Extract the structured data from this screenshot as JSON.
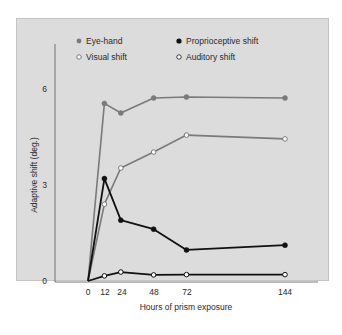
{
  "chart_data": {
    "type": "line",
    "title": "",
    "xlabel": "Hours of prism exposure",
    "ylabel": "Adaptive shift (deg.)",
    "x": [
      0,
      12,
      24,
      48,
      72,
      144
    ],
    "xticks": [
      "0",
      "12",
      "24",
      "48",
      "72",
      "144"
    ],
    "yticks": [
      "0",
      "3",
      "6"
    ],
    "xlim": [
      0,
      150
    ],
    "ylim": [
      0,
      7.5
    ],
    "grid": false,
    "legend_position": "top",
    "series": [
      {
        "name": "Eye-hand",
        "marker": "filled-gray",
        "color": "#7a7a7a",
        "values": [
          0,
          5.55,
          5.25,
          5.72,
          5.75,
          5.72
        ]
      },
      {
        "name": "Proprioceptive shift",
        "marker": "filled-black",
        "color": "#111111",
        "values": [
          0,
          3.2,
          1.9,
          1.62,
          0.97,
          1.12
        ]
      },
      {
        "name": "Visual shift",
        "marker": "open-gray",
        "color": "#7a7a7a",
        "values": [
          0,
          2.4,
          3.53,
          4.03,
          4.56,
          4.44
        ]
      },
      {
        "name": "Auditory shift",
        "marker": "open-black",
        "color": "#111111",
        "values": [
          0,
          0.16,
          0.28,
          0.19,
          0.2,
          0.2
        ]
      }
    ]
  },
  "legend": {
    "eye_hand": "Eye-hand",
    "proprioceptive": "Proprioceptive shift",
    "visual": "Visual shift",
    "auditory": "Auditory shift"
  },
  "axes": {
    "xlabel": "Hours of prism exposure",
    "ylabel": "Adaptive shift (deg.)",
    "yticks": [
      "0",
      "3",
      "6"
    ],
    "xticks": [
      "0",
      "12",
      "24",
      "48",
      "72",
      "144"
    ]
  }
}
